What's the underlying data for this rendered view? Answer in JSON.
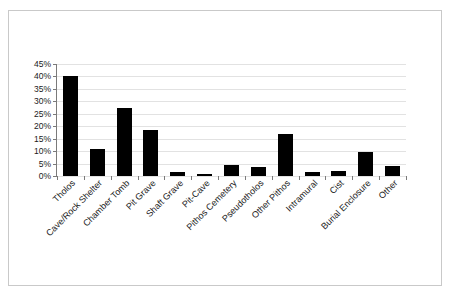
{
  "chart_data": {
    "type": "bar",
    "title": "",
    "subtitle": "",
    "xlabel": "",
    "ylabel": "",
    "ylim": [
      0,
      45
    ],
    "ytick_labels": [
      "45%",
      "40%",
      "35%",
      "30%",
      "25%",
      "20%",
      "15%",
      "10%",
      "5%",
      "0%"
    ],
    "ytick_values": [
      45,
      40,
      35,
      30,
      25,
      20,
      15,
      10,
      5,
      0
    ],
    "grid": true,
    "legend": "none",
    "bar_color": "#000000",
    "categories": [
      "Tholos",
      "Cave/Rock Shelter",
      "Chamber Tomb",
      "Pit Grave",
      "Shaft Grave",
      "Pit-Cave",
      "Pithos Cemetery",
      "Pseudotholos",
      "Other Pithos",
      "Intramural",
      "Cist",
      "Burial Enclosure",
      "Other"
    ],
    "values": [
      40,
      11,
      27.5,
      18.5,
      1.5,
      0.8,
      4.5,
      3.8,
      17,
      1.5,
      2,
      9.5,
      4
    ]
  }
}
